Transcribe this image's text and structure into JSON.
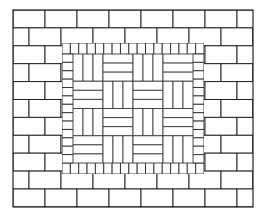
{
  "figure": {
    "canvas": {
      "width": 267,
      "height": 217
    },
    "colors": {
      "background": "#ffffff",
      "brick_fill": "#ffffff",
      "line": "#1a1a1a"
    },
    "outline": {
      "x": 13,
      "y": 10,
      "width": 240,
      "height": 197
    }
  },
  "regions": {
    "outer_border": {
      "name": "running-bond border",
      "bond": "running bond",
      "orientation": "horizontal stretchers",
      "brick_length": 32,
      "brick_height": 17.9,
      "row_count": 11,
      "offset": "half brick per row"
    },
    "soldier_frame": {
      "name": "soldier course frame",
      "orientation": "vertical headers on all four sides",
      "brick_width": 8.6,
      "band_thickness": 11,
      "bounds": {
        "x": 62,
        "y": 43,
        "width": 142,
        "height": 131
      }
    },
    "basketweave_field": {
      "name": "basketweave field",
      "pattern": "basketweave",
      "grid_columns": 4,
      "grid_rows": 4,
      "bricks_per_block": 3,
      "block_width": 30,
      "block_height": 27.25,
      "bounds": {
        "x": 73,
        "y": 54,
        "width": 120,
        "height": 109
      },
      "first_block_orientation": "vertical"
    }
  },
  "legend": {
    "items": [
      {
        "key": "border",
        "label": "Running bond border"
      },
      {
        "key": "soldier",
        "label": "Soldier course frame"
      },
      {
        "key": "weave",
        "label": "Basketweave field"
      }
    ]
  }
}
